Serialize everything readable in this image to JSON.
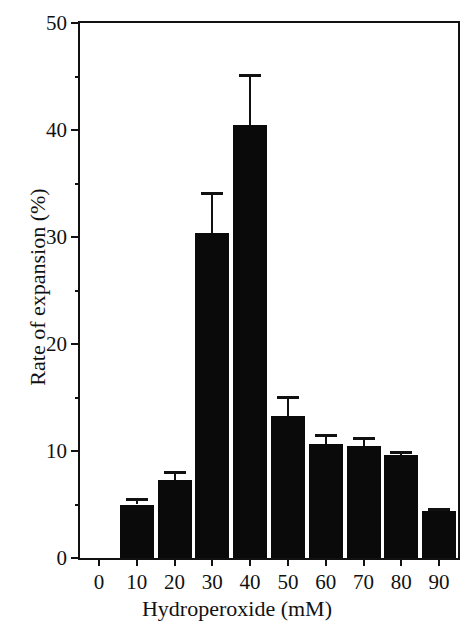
{
  "chart_data": {
    "type": "bar",
    "title": "",
    "xlabel": "Hydroperoxide (mM)",
    "ylabel": "Rate of expansion (%)",
    "categories": [
      "0",
      "10",
      "20",
      "30",
      "40",
      "50",
      "60",
      "70",
      "80",
      "90"
    ],
    "values": [
      null,
      5.0,
      7.3,
      30.4,
      40.5,
      13.3,
      10.7,
      10.5,
      9.6,
      4.4
    ],
    "errors": [
      null,
      0.6,
      0.8,
      3.8,
      4.7,
      1.8,
      0.9,
      0.8,
      0.4,
      0.3
    ],
    "series": [
      {
        "name": "Rate of expansion",
        "values": [
          null,
          5.0,
          7.3,
          30.4,
          40.5,
          13.3,
          10.7,
          10.5,
          9.6,
          4.4
        ],
        "errors": [
          null,
          0.6,
          0.8,
          3.8,
          4.7,
          1.8,
          0.9,
          0.8,
          0.4,
          0.3
        ]
      }
    ],
    "bars": [
      {
        "category": "0",
        "value": null,
        "error": null
      },
      {
        "category": "10",
        "value": 5.0,
        "error": 0.6
      },
      {
        "category": "20",
        "value": 7.3,
        "error": 0.8
      },
      {
        "category": "30",
        "value": 30.4,
        "error": 3.8
      },
      {
        "category": "40",
        "value": 40.5,
        "error": 4.7
      },
      {
        "category": "50",
        "value": 13.3,
        "error": 1.8
      },
      {
        "category": "60",
        "value": 10.7,
        "error": 0.9
      },
      {
        "category": "70",
        "value": 10.5,
        "error": 0.8
      },
      {
        "category": "80",
        "value": 9.6,
        "error": 0.4
      },
      {
        "category": "90",
        "value": 4.4,
        "error": 0.3
      }
    ],
    "ylim": [
      0,
      50
    ],
    "xlim": [
      -5,
      95
    ],
    "y_major_ticks": [
      0,
      10,
      20,
      30,
      40,
      50
    ],
    "y_minor_ticks": [
      5,
      15,
      25,
      35,
      45
    ],
    "y_tick_labels": [
      "0",
      "10",
      "20",
      "30",
      "40",
      "50"
    ],
    "x_ticks": [
      0,
      10,
      20,
      30,
      40,
      50,
      60,
      70,
      80,
      90
    ],
    "x_tick_labels": [
      "0",
      "10",
      "20",
      "30",
      "40",
      "50",
      "60",
      "70",
      "80",
      "90"
    ],
    "grid": false,
    "legend": null,
    "legend_position": "none",
    "bar_color": "#0a0a0a",
    "axis_color": "#111111",
    "background_color": "#ffffff",
    "error_bar_style": "upper-only-with-cap",
    "annotations": []
  }
}
